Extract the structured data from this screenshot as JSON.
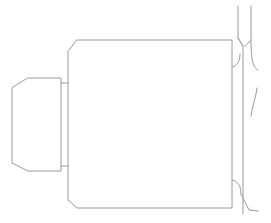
{
  "diagram": {
    "type": "technical-line-drawing",
    "background": "#ffffff",
    "stroke_color": "#9a9a9a",
    "parts": [
      {
        "name": "main-body",
        "points": [
          [
            77,
            40
          ],
          [
            232,
            40
          ],
          [
            232,
            208
          ],
          [
            77,
            208
          ],
          [
            68,
            200
          ],
          [
            68,
            52
          ]
        ]
      },
      {
        "name": "end-cap",
        "points": [
          [
            28,
            78
          ],
          [
            61,
            78
          ],
          [
            61,
            171
          ],
          [
            28,
            171
          ],
          [
            12,
            163
          ],
          [
            12,
            88
          ]
        ]
      },
      {
        "name": "collar",
        "lines": [
          [
            [
              61,
              83
            ],
            [
              68,
              83
            ]
          ],
          [
            [
              61,
              166
            ],
            [
              68,
              166
            ]
          ]
        ]
      }
    ],
    "right_assembly": {
      "shaft_lines": [
        [
          [
            238,
            6
          ],
          [
            238,
            38
          ],
          [
            243,
            46
          ],
          [
            243,
            214
          ]
        ],
        [
          [
            251,
            6
          ],
          [
            251,
            40
          ],
          [
            245,
            46
          ]
        ],
        [
          [
            238,
            38
          ],
          [
            243,
            46
          ]
        ]
      ],
      "curves": [
        "M232 67 C238 66, 240 60, 240 54",
        "M251 40 C251 60, 253 68, 258 70",
        "M257 88 C256 98, 252 106, 251 116",
        "M232 180 C238 181, 241 186, 241 194",
        "M241 194 L249 210 L258 211"
      ]
    }
  }
}
